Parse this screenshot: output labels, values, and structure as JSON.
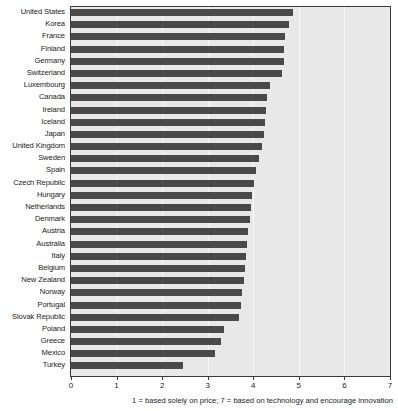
{
  "chart_data": {
    "type": "bar",
    "orientation": "horizontal",
    "title": "",
    "subtitle": "",
    "xlabel": "",
    "ylabel": "",
    "xlim": [
      0,
      7
    ],
    "ylim": null,
    "grid": true,
    "legend": null,
    "xticks": [
      0,
      1,
      2,
      3,
      4,
      5,
      6,
      7
    ],
    "xtick_labels": [
      "0",
      "1",
      "2",
      "3",
      "4",
      "5",
      "6",
      "7"
    ],
    "annotation": "1 = based solely on price; 7 = based on technology and encourage innovation",
    "categories": [
      "United States",
      "Korea",
      "France",
      "Finland",
      "Germany",
      "Switzerland",
      "Luxembourg",
      "Canada",
      "Ireland",
      "Iceland",
      "Japan",
      "United Kingdom",
      "Sweden",
      "Spain",
      "Czech Republic",
      "Hungary",
      "Netherlands",
      "Denmark",
      "Austria",
      "Australia",
      "Italy",
      "Belgium",
      "New Zealand",
      "Norway",
      "Portugal",
      "Slovak Republic",
      "Poland",
      "Greece",
      "Mexico",
      "Turkey"
    ],
    "values": [
      4.88,
      4.79,
      4.7,
      4.67,
      4.67,
      4.64,
      4.36,
      4.29,
      4.27,
      4.25,
      4.23,
      4.2,
      4.12,
      4.05,
      4.02,
      3.97,
      3.94,
      3.92,
      3.89,
      3.87,
      3.84,
      3.82,
      3.79,
      3.75,
      3.72,
      3.69,
      3.35,
      3.3,
      3.16,
      2.46
    ],
    "bar_color": "#4a4a4a",
    "plot_background": "#e8e8e8",
    "gridline_color": "#f7f7f7",
    "axis_color": "#3a3a3a"
  }
}
